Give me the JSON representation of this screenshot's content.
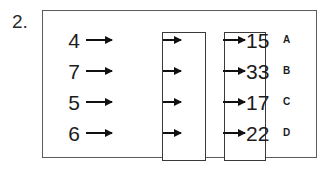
{
  "question": {
    "number": "2."
  },
  "diagram": {
    "type": "function-machine",
    "machines": [
      {
        "id": "machine-1",
        "label": ""
      },
      {
        "id": "machine-2",
        "label": ""
      }
    ],
    "rows": [
      {
        "input": "4",
        "output": "15",
        "letter": "A"
      },
      {
        "input": "7",
        "output": "33",
        "letter": "B"
      },
      {
        "input": "5",
        "output": "17",
        "letter": "C"
      },
      {
        "input": "6",
        "output": "22",
        "letter": "D"
      }
    ]
  },
  "colors": {
    "frame": "#5c5c5c",
    "box": "#3a3a3a",
    "arrow": "#111111",
    "text": "#1c1c1c",
    "background": "#ffffff"
  }
}
